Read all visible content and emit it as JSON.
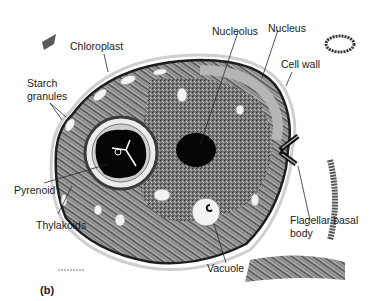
{
  "figure": {
    "panel_label": "(b)",
    "labels": {
      "chloroplast": "Chloroplast",
      "starch_line1": "Starch",
      "starch_line2": "granules",
      "nucleolus": "Nucleolus",
      "nucleus": "Nucleus",
      "cell_wall": "Cell wall",
      "pyrenoid": "Pyrenoid",
      "thylakoids": "Thylakoids",
      "flagellar_line1": "Flagellar basal",
      "flagellar_line2": "body",
      "vacuole": "Vacuole"
    },
    "colors": {
      "background": "#ffffff",
      "cytoplasm": "#6e6e6e",
      "chloroplast": "#9a9a9a",
      "dense": "#0a0a0a",
      "wall": "#cfcfcf",
      "text": "#1a1a1a"
    }
  }
}
